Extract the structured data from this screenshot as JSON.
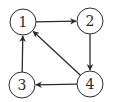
{
  "diagram": {
    "type": "directed-graph",
    "nodes": [
      {
        "id": "1",
        "label": "1",
        "x": 23,
        "y": 22
      },
      {
        "id": "2",
        "label": "2",
        "x": 90,
        "y": 21
      },
      {
        "id": "3",
        "label": "3",
        "x": 22,
        "y": 85
      },
      {
        "id": "4",
        "label": "4",
        "x": 90,
        "y": 84
      }
    ],
    "edges": [
      {
        "from": "1",
        "to": "2"
      },
      {
        "from": "2",
        "to": "4"
      },
      {
        "from": "4",
        "to": "3"
      },
      {
        "from": "3",
        "to": "1"
      },
      {
        "from": "4",
        "to": "1"
      }
    ],
    "colors": {
      "stroke": "#2b2b2b",
      "fill": "#ffffff",
      "text": "#2b2b2b"
    }
  }
}
